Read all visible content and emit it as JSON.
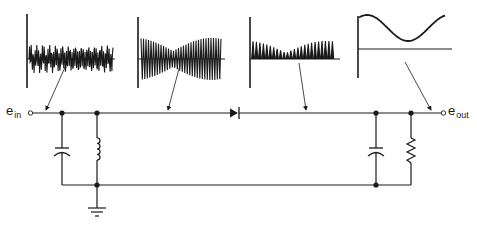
{
  "labels": {
    "input": {
      "symbol": "e",
      "subscript": "in"
    },
    "output": {
      "symbol": "e",
      "subscript": "out"
    }
  },
  "circuit": {
    "components": [
      {
        "type": "input-terminal",
        "label": "e_in"
      },
      {
        "type": "capacitor",
        "position": "shunt",
        "stage": "input tank"
      },
      {
        "type": "inductor",
        "position": "shunt",
        "stage": "input tank"
      },
      {
        "type": "ground",
        "position": "bottom rail"
      },
      {
        "type": "diode",
        "position": "series",
        "direction": "left-to-right"
      },
      {
        "type": "capacitor",
        "position": "shunt",
        "stage": "output filter"
      },
      {
        "type": "resistor",
        "position": "shunt",
        "stage": "output load"
      },
      {
        "type": "output-terminal",
        "label": "e_out"
      }
    ]
  },
  "waveforms": [
    {
      "id": "w1",
      "description": "AM input signal with mixed frequencies",
      "points_to": "input wire"
    },
    {
      "id": "w2",
      "description": "selected amplitude-modulated carrier",
      "points_to": "tank output wire"
    },
    {
      "id": "w3",
      "description": "rectified (half-wave) modulated carrier",
      "points_to": "after diode"
    },
    {
      "id": "w4",
      "description": "recovered audio envelope (sine)",
      "points_to": "output wire"
    }
  ],
  "colors": {
    "ink": "#1a1a1a",
    "background": "#ffffff"
  }
}
